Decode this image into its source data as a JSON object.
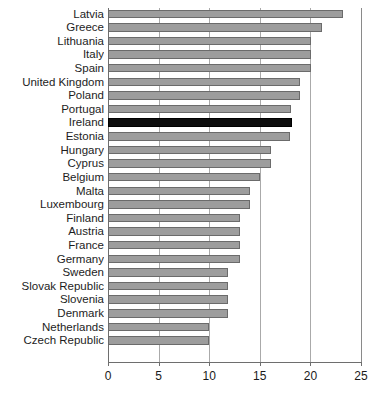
{
  "chart_data": {
    "type": "bar",
    "orientation": "horizontal",
    "title": "",
    "subtitle": "",
    "xlabel": "",
    "ylabel": "",
    "xlim": [
      0,
      25
    ],
    "grid": true,
    "legend": false,
    "xticks": [
      0,
      5,
      10,
      15,
      20,
      25
    ],
    "xtick_labels": [
      "0",
      "5",
      "10",
      "15",
      "20",
      "25"
    ],
    "highlight_category": "Ireland",
    "colors": {
      "bar": "#9d9d9d",
      "bar_border": "#6b6b6b",
      "highlight_bar": "#0d0d0d",
      "gridline": "#aaaaaa",
      "axis": "#6e6e6e",
      "label_text": "#1d1d1d",
      "background": "#ffffff"
    },
    "categories": [
      "Latvia",
      "Greece",
      "Lithuania",
      "Italy",
      "Spain",
      "United Kingdom",
      "Poland",
      "Portugal",
      "Ireland",
      "Estonia",
      "Hungary",
      "Cyprus",
      "Belgium",
      "Malta",
      "Luxembourg",
      "Finland",
      "Austria",
      "France",
      "Germany",
      "Sweden",
      "Slovak Republic",
      "Slovenia",
      "Denmark",
      "Netherlands",
      "Czech Republic"
    ],
    "values": [
      23.2,
      21.1,
      20.1,
      20.1,
      20.1,
      19.0,
      19.0,
      18.1,
      18.2,
      18.0,
      16.1,
      16.1,
      15.0,
      14.0,
      14.0,
      13.0,
      13.0,
      13.0,
      13.0,
      11.9,
      11.9,
      11.9,
      11.9,
      10.0,
      10.0
    ]
  }
}
